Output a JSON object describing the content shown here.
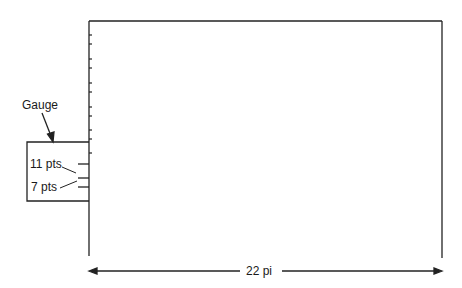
{
  "diagram": {
    "gauge_label": "Gauge",
    "gauge_marks": [
      {
        "label": "11 pts"
      },
      {
        "label": "7 pts"
      }
    ],
    "width_label": "22 pi",
    "colors": {
      "line": "#222222",
      "background": "#ffffff"
    }
  }
}
